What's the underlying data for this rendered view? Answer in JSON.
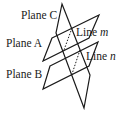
{
  "diagram": {
    "title": "",
    "planes": [
      {
        "id": "plane-a",
        "label": "Plane A"
      },
      {
        "id": "plane-b",
        "label": "Plane B"
      },
      {
        "id": "plane-c",
        "label": "Plane C"
      }
    ],
    "lines": [
      {
        "id": "line-m",
        "label_prefix": "Line ",
        "label_var": "m"
      },
      {
        "id": "line-n",
        "label_prefix": "Line ",
        "label_var": "n"
      }
    ]
  },
  "colors": {
    "stroke": "#1a1a1a",
    "background": "#ffffff"
  }
}
